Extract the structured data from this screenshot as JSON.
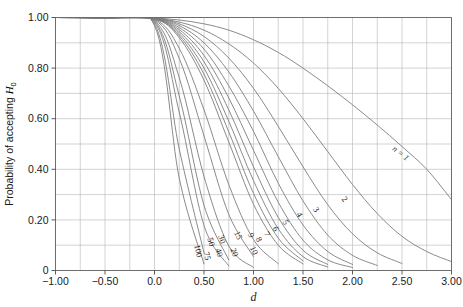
{
  "chart_data": {
    "type": "line",
    "title": "",
    "xlabel": "d",
    "ylabel": "Probability of accepting H0",
    "ylabel_prefix": "Probability of accepting ",
    "ylabel_symbol": "H",
    "ylabel_subscript": "0",
    "xlim": [
      -1.0,
      3.0
    ],
    "ylim": [
      0.0,
      1.0
    ],
    "grid": true,
    "grid_x_step": 0.25,
    "grid_y_step": 0.1,
    "legend_position": "inline-curve-labels",
    "x_ticks": [
      -1.0,
      -0.5,
      0.0,
      0.5,
      1.0,
      1.5,
      2.0,
      2.5,
      3.0
    ],
    "x_tick_labels": [
      "−1.00",
      "−0.50",
      "0.0",
      "0.50",
      "1.00",
      "1.50",
      "2.00",
      "2.50",
      "3.00"
    ],
    "y_ticks": [
      0.0,
      0.2,
      0.4,
      0.6,
      0.8,
      1.0
    ],
    "y_tick_labels": [
      "0",
      "0.20",
      "0.40",
      "0.60",
      "0.80",
      "1.00"
    ],
    "x_minor_step": 0.25,
    "y_minor_step": 0.1,
    "curve_color": "#7d7d7d",
    "grid_color": "#b6b6b6",
    "axis_color": "#6d6d6d",
    "background_color": "#ffffff",
    "series_label_prefix": "n = ",
    "first_series_label": "n = 1",
    "series": [
      {
        "name": "1",
        "label": "n = 1",
        "n": 1,
        "x": [
          -1.0,
          -0.75,
          -0.5,
          -0.25,
          0.0,
          0.25,
          0.5,
          0.75,
          1.0,
          1.25,
          1.5,
          1.75,
          2.0,
          2.25,
          2.5,
          2.75,
          3.0
        ],
        "values": [
          1.0,
          1.0,
          0.999,
          0.999,
          0.998,
          0.99,
          0.975,
          0.95,
          0.912,
          0.862,
          0.8,
          0.73,
          0.655,
          0.575,
          0.49,
          0.4,
          0.28
        ]
      },
      {
        "name": "2",
        "label": "2",
        "n": 2,
        "x": [
          -1.0,
          -0.75,
          -0.5,
          -0.25,
          0.0,
          0.25,
          0.5,
          0.75,
          1.0,
          1.25,
          1.5,
          1.75,
          2.0,
          2.25,
          2.5,
          2.75,
          3.0
        ],
        "values": [
          1.0,
          1.0,
          0.999,
          0.999,
          0.997,
          0.982,
          0.95,
          0.896,
          0.82,
          0.72,
          0.6,
          0.47,
          0.34,
          0.225,
          0.135,
          0.075,
          0.035
        ]
      },
      {
        "name": "3",
        "label": "3",
        "n": 3,
        "x": [
          -1.0,
          -0.5,
          0.0,
          0.25,
          0.5,
          0.75,
          1.0,
          1.25,
          1.5,
          1.75,
          2.0,
          2.25,
          2.5
        ],
        "values": [
          1.0,
          0.999,
          0.997,
          0.975,
          0.925,
          0.84,
          0.72,
          0.57,
          0.41,
          0.26,
          0.145,
          0.07,
          0.028
        ]
      },
      {
        "name": "4",
        "label": "4",
        "n": 4,
        "x": [
          -1.0,
          -0.5,
          0.0,
          0.25,
          0.5,
          0.75,
          1.0,
          1.25,
          1.5,
          1.75,
          2.0,
          2.25
        ],
        "values": [
          1.0,
          0.999,
          0.997,
          0.968,
          0.9,
          0.785,
          0.63,
          0.45,
          0.275,
          0.14,
          0.06,
          0.02
        ]
      },
      {
        "name": "5",
        "label": "5",
        "n": 5,
        "x": [
          -1.0,
          -0.5,
          0.0,
          0.25,
          0.5,
          0.75,
          1.0,
          1.25,
          1.5,
          1.75,
          2.0
        ],
        "values": [
          1.0,
          0.999,
          0.996,
          0.96,
          0.875,
          0.73,
          0.55,
          0.345,
          0.18,
          0.075,
          0.024
        ]
      },
      {
        "name": "6",
        "label": "6",
        "n": 6,
        "x": [
          -1.0,
          -0.5,
          0.0,
          0.25,
          0.5,
          0.75,
          1.0,
          1.25,
          1.5,
          1.75,
          2.0
        ],
        "values": [
          1.0,
          0.999,
          0.996,
          0.952,
          0.85,
          0.682,
          0.475,
          0.27,
          0.12,
          0.042,
          0.012
        ]
      },
      {
        "name": "7",
        "label": "7",
        "n": 7,
        "x": [
          -1.0,
          -0.5,
          0.0,
          0.25,
          0.5,
          0.75,
          1.0,
          1.25,
          1.5,
          1.75
        ],
        "values": [
          1.0,
          0.999,
          0.995,
          0.944,
          0.825,
          0.635,
          0.41,
          0.21,
          0.08,
          0.024
        ]
      },
      {
        "name": "8",
        "label": "8",
        "n": 8,
        "x": [
          -1.0,
          -0.5,
          0.0,
          0.25,
          0.5,
          0.75,
          1.0,
          1.25,
          1.5,
          1.75
        ],
        "values": [
          1.0,
          0.999,
          0.995,
          0.936,
          0.8,
          0.59,
          0.355,
          0.165,
          0.055,
          0.014
        ]
      },
      {
        "name": "9",
        "label": "9",
        "n": 9,
        "x": [
          -1.0,
          -0.5,
          0.0,
          0.25,
          0.5,
          0.75,
          1.0,
          1.25,
          1.5
        ],
        "values": [
          1.0,
          0.999,
          0.994,
          0.928,
          0.776,
          0.548,
          0.305,
          0.128,
          0.038
        ]
      },
      {
        "name": "10",
        "label": "10",
        "n": 10,
        "x": [
          -1.0,
          -0.5,
          0.0,
          0.25,
          0.5,
          0.75,
          1.0,
          1.25,
          1.5
        ],
        "values": [
          1.0,
          0.999,
          0.994,
          0.92,
          0.752,
          0.508,
          0.262,
          0.1,
          0.026
        ]
      },
      {
        "name": "15",
        "label": "15",
        "n": 15,
        "x": [
          -1.0,
          -0.5,
          0.0,
          0.25,
          0.5,
          0.75,
          1.0,
          1.25
        ],
        "values": [
          1.0,
          0.999,
          0.992,
          0.878,
          0.635,
          0.34,
          0.122,
          0.027
        ]
      },
      {
        "name": "20",
        "label": "20",
        "n": 20,
        "x": [
          -1.0,
          -0.5,
          0.0,
          0.25,
          0.5,
          0.75,
          1.0
        ],
        "values": [
          1.0,
          0.998,
          0.99,
          0.838,
          0.532,
          0.222,
          0.055
        ]
      },
      {
        "name": "30",
        "label": "30",
        "n": 30,
        "x": [
          -1.0,
          -0.5,
          0.0,
          0.25,
          0.5,
          0.75,
          1.0
        ],
        "values": [
          1.0,
          0.998,
          0.987,
          0.762,
          0.372,
          0.097,
          0.012
        ]
      },
      {
        "name": "40",
        "label": "40",
        "n": 40,
        "x": [
          -1.0,
          -0.5,
          0.0,
          0.25,
          0.5,
          0.75
        ],
        "values": [
          1.0,
          0.998,
          0.984,
          0.69,
          0.258,
          0.042
        ]
      },
      {
        "name": "50",
        "label": "50",
        "n": 50,
        "x": [
          -1.0,
          -0.5,
          0.0,
          0.25,
          0.5,
          0.75
        ],
        "values": [
          1.0,
          0.997,
          0.981,
          0.625,
          0.178,
          0.018
        ]
      },
      {
        "name": "75",
        "label": "75",
        "n": 75,
        "x": [
          -1.0,
          -0.5,
          0.0,
          0.25,
          0.5
        ],
        "values": [
          1.0,
          0.997,
          0.975,
          0.48,
          0.07
        ]
      },
      {
        "name": "100",
        "label": "100",
        "n": 100,
        "x": [
          -1.0,
          -0.5,
          0.0,
          0.25,
          0.5
        ],
        "values": [
          1.0,
          0.996,
          0.968,
          0.365,
          0.026
        ]
      }
    ],
    "curve_labels": [
      {
        "text": "n = 1",
        "x": 2.47,
        "y": 0.455,
        "rotation": 38
      },
      {
        "text": "2",
        "x": 1.9,
        "y": 0.275,
        "rotation": 52
      },
      {
        "text": "3",
        "x": 1.61,
        "y": 0.235,
        "rotation": 56
      },
      {
        "text": "4",
        "x": 1.44,
        "y": 0.215,
        "rotation": 58
      },
      {
        "text": "5",
        "x": 1.3,
        "y": 0.185,
        "rotation": 60
      },
      {
        "text": "6",
        "x": 1.2,
        "y": 0.16,
        "rotation": 62
      },
      {
        "text": "7",
        "x": 1.11,
        "y": 0.14,
        "rotation": 63
      },
      {
        "text": "8",
        "x": 1.03,
        "y": 0.118,
        "rotation": 64
      },
      {
        "text": "9",
        "x": 0.95,
        "y": 0.135,
        "rotation": 65
      },
      {
        "text": "10",
        "x": 0.98,
        "y": 0.075,
        "rotation": 66
      },
      {
        "text": "15",
        "x": 0.82,
        "y": 0.135,
        "rotation": 68
      },
      {
        "text": "20",
        "x": 0.78,
        "y": 0.068,
        "rotation": 70
      },
      {
        "text": "30",
        "x": 0.655,
        "y": 0.12,
        "rotation": 72
      },
      {
        "text": "40",
        "x": 0.625,
        "y": 0.068,
        "rotation": 73
      },
      {
        "text": "50",
        "x": 0.545,
        "y": 0.11,
        "rotation": 74
      },
      {
        "text": "75",
        "x": 0.505,
        "y": 0.055,
        "rotation": 76
      },
      {
        "text": "100",
        "x": 0.415,
        "y": 0.075,
        "rotation": 78
      }
    ]
  }
}
